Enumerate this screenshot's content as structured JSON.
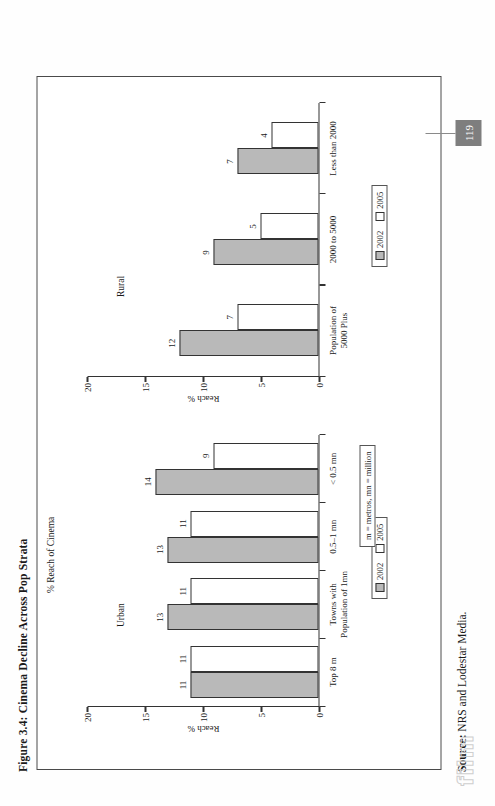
{
  "page": {
    "figure_title": "Figure 3.4:   Cinema Decline Across Pop Strata",
    "source_prefix": "Source:",
    "source_text": " NRS and Lodestar Media.",
    "page_number": "119",
    "watermark": "film"
  },
  "figure": {
    "heading": "% Reach of Cinema",
    "note": "m = metros, mn = million",
    "legend": {
      "series1": "2002",
      "series2": "2005"
    },
    "panels": [
      {
        "title": "Urban",
        "axis_title": "Reach %"
      },
      {
        "title": "Rural",
        "axis_title": "Reach %"
      }
    ]
  },
  "chart_data": [
    {
      "type": "bar",
      "title": "Urban",
      "xlabel": "",
      "ylabel": "Reach %",
      "ylim": [
        0,
        20
      ],
      "yticks": [
        0,
        5,
        10,
        15,
        20
      ],
      "grid": false,
      "legend_position": "bottom",
      "categories": [
        "Top 8 m",
        "Towns with\nPopulation of 1mn",
        "0.5–1 mn",
        "< 0.5 mn"
      ],
      "series": [
        {
          "name": "2002",
          "color": "#b9b9b9",
          "values": [
            11,
            13,
            13,
            14
          ]
        },
        {
          "name": "2005",
          "color": "#ffffff",
          "values": [
            11,
            11,
            11,
            9
          ]
        }
      ]
    },
    {
      "type": "bar",
      "title": "Rural",
      "xlabel": "",
      "ylabel": "Reach %",
      "ylim": [
        0,
        20
      ],
      "yticks": [
        0,
        5,
        10,
        15,
        20
      ],
      "grid": false,
      "legend_position": "bottom",
      "categories": [
        "Population of\n5000 Plus",
        "2000 to 5000",
        "Less than 2000"
      ],
      "series": [
        {
          "name": "2002",
          "color": "#b9b9b9",
          "values": [
            12,
            9,
            7
          ]
        },
        {
          "name": "2005",
          "color": "#ffffff",
          "values": [
            7,
            5,
            4
          ]
        }
      ]
    }
  ]
}
